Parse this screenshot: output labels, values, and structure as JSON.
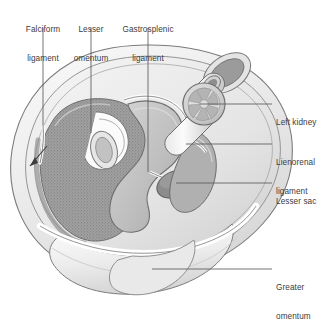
{
  "figure": {
    "type": "anatomical-cross-section",
    "background_color": "#ffffff",
    "text_color": "#3c3c3c",
    "leader_color": "#5a5a5a",
    "palette": {
      "body_wall_outer": "#f2f2f2",
      "body_wall_mid": "#e2e2e2",
      "peritoneum_line": "#8f8f8f",
      "liver_fill": "#9a9a9a",
      "liver_stipple": "#7d7d7d",
      "stomach_fill": "#bdbdbd",
      "spleen_fill": "#a8a8a8",
      "lesser_sac_fill": "#8a8a8a",
      "kidney_fill": "#d0d0d0",
      "vessel_fill": "#cfcfcf",
      "omentum_fill": "#efefef",
      "outline": "#6e6e6e"
    }
  },
  "labels": {
    "falciform_ligament": {
      "id": "falciform-ligament",
      "line1": "Falciform",
      "line2": "ligament",
      "align": "center",
      "x": 12,
      "y": 6,
      "leader": {
        "x1": 43,
        "y1": 28,
        "x2": 43,
        "y2": 126
      }
    },
    "lesser_omentum": {
      "id": "lesser-omentum",
      "line1": "Lesser",
      "line2": "omentum",
      "align": "center",
      "x": 69,
      "y": 6,
      "leader": {
        "x1": 91,
        "y1": 28,
        "x2": 91,
        "y2": 133
      }
    },
    "gastrosplenic_ligament": {
      "id": "gastrosplenic-ligament",
      "line1": "Gastrosplenic",
      "line2": "ligament",
      "align": "center",
      "x": 117,
      "y": 6,
      "leader": {
        "x1": 148,
        "y1": 28,
        "x2": 148,
        "y2": 172
      }
    },
    "left_kidney": {
      "id": "left-kidney",
      "line1": "Left kidney",
      "line2": "",
      "align": "left",
      "x": 276,
      "y": 99,
      "leader": {
        "x1": 200,
        "y1": 104,
        "x2": 272,
        "y2": 104
      }
    },
    "lienorenal_ligament": {
      "id": "lienorenal-ligament",
      "line1": "Lienorenal",
      "line2": "ligament",
      "align": "left",
      "x": 276,
      "y": 139,
      "leader": {
        "x1": 186,
        "y1": 144,
        "x2": 272,
        "y2": 144
      }
    },
    "lesser_sac": {
      "id": "lesser-sac",
      "line1": "Lesser sac",
      "line2": "",
      "align": "left",
      "x": 276,
      "y": 178,
      "leader": {
        "x1": 176,
        "y1": 183,
        "x2": 272,
        "y2": 183
      }
    },
    "greater_omentum": {
      "id": "greater-omentum",
      "line1": "Greater",
      "line2": "omentum",
      "align": "left",
      "x": 276,
      "y": 264,
      "leader": {
        "x1": 152,
        "y1": 269,
        "x2": 272,
        "y2": 269
      }
    }
  },
  "structures": [
    {
      "name": "body-wall",
      "label": "Abdominal wall"
    },
    {
      "name": "liver",
      "label": "Liver"
    },
    {
      "name": "stomach",
      "label": "Stomach"
    },
    {
      "name": "spleen",
      "label": "Spleen"
    },
    {
      "name": "left-kidney",
      "label": "Left kidney"
    },
    {
      "name": "aorta",
      "label": "Aorta"
    },
    {
      "name": "inferior-vena-cava",
      "label": "Inferior vena cava"
    },
    {
      "name": "vertebral-body",
      "label": "Vertebral body"
    },
    {
      "name": "lesser-sac",
      "label": "Lesser sac"
    },
    {
      "name": "greater-omentum",
      "label": "Greater omentum"
    },
    {
      "name": "falciform-ligament",
      "label": "Falciform ligament"
    },
    {
      "name": "lesser-omentum",
      "label": "Lesser omentum"
    },
    {
      "name": "gastrosplenic-ligament",
      "label": "Gastrosplenic ligament"
    },
    {
      "name": "lienorenal-ligament",
      "label": "Lienorenal ligament"
    },
    {
      "name": "peritoneal-cavity-arrow",
      "label": "Peritoneal cavity direction arrow"
    }
  ]
}
